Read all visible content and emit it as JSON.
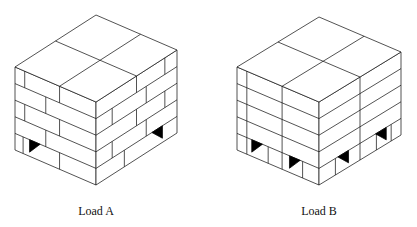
{
  "figure": {
    "loads": [
      {
        "id": "A",
        "label": "Load A",
        "label_pos": [
          96,
          204
        ],
        "front_top": [
          96,
          102
        ],
        "left_vec": [
          -81,
          -35
        ],
        "right_vec": [
          81,
          -52
        ],
        "height": 83,
        "tiers": 5,
        "pattern": "interlocked-brick",
        "top_divisions": {
          "left": [
            0.45
          ],
          "right": [
            0.5
          ]
        },
        "pallet_openings": [
          "left-face",
          "right-face"
        ]
      },
      {
        "id": "B",
        "label": "Load B",
        "label_pos": [
          319,
          204
        ],
        "front_top": [
          319,
          102
        ],
        "left_vec": [
          -82,
          -35
        ],
        "right_vec": [
          82,
          -50
        ],
        "height": 83,
        "tiers": 5,
        "pattern": "column-stacked",
        "top_divisions": {
          "left": [
            0.45
          ],
          "right": [
            0.5
          ]
        },
        "pallet_openings": [
          "left-face-2",
          "right-face-2"
        ]
      }
    ]
  }
}
